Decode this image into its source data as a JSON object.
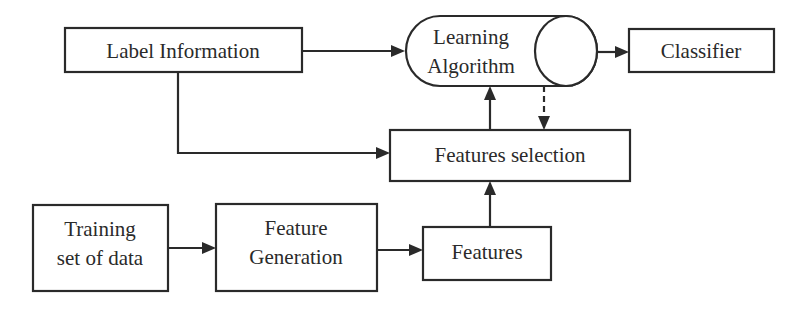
{
  "diagram": {
    "type": "flowchart",
    "nodes": {
      "label_information": {
        "label": "Label Information"
      },
      "learning_algorithm": {
        "line1": "Learning",
        "line2": "Algorithm",
        "shape": "cylinder"
      },
      "classifier": {
        "label": "Classifier"
      },
      "features_selection": {
        "label": "Features selection"
      },
      "training_set": {
        "line1": "Training",
        "line2": "set of data"
      },
      "feature_generation": {
        "line1": "Feature",
        "line2": "Generation"
      },
      "features": {
        "label": "Features"
      }
    },
    "edges": [
      {
        "from": "Label Information",
        "to": "Learning Algorithm",
        "style": "solid"
      },
      {
        "from": "Label Information",
        "to": "Features selection",
        "style": "solid"
      },
      {
        "from": "Learning Algorithm",
        "to": "Classifier",
        "style": "solid"
      },
      {
        "from": "Features selection",
        "to": "Learning Algorithm",
        "style": "solid"
      },
      {
        "from": "Learning Algorithm",
        "to": "Features selection",
        "style": "dashed"
      },
      {
        "from": "Training set of data",
        "to": "Feature Generation",
        "style": "solid"
      },
      {
        "from": "Feature Generation",
        "to": "Features",
        "style": "solid"
      },
      {
        "from": "Features",
        "to": "Features selection",
        "style": "solid"
      }
    ],
    "colors": {
      "stroke": "#2a2a2a",
      "background": "#ffffff"
    }
  }
}
